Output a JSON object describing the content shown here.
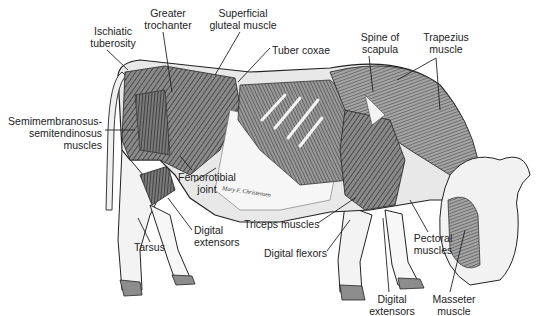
{
  "figure": {
    "signature": "Mary F. Christensen",
    "colors": {
      "ink": "#1e1e1e",
      "muscle_dark": "#3a3a3a",
      "muscle_mid": "#7a7a7a",
      "muscle_light": "#b8b8b8",
      "hoof": "#8c8c8c",
      "background": "#ffffff"
    }
  },
  "labels": [
    {
      "id": "ischiatic-tuberosity",
      "text": "Ischiatic\ntuberosity",
      "x": 82,
      "y": 25,
      "align": "c",
      "w": 62
    },
    {
      "id": "greater-trochanter",
      "text": "Greater\ntrochanter",
      "x": 136,
      "y": 7,
      "align": "c",
      "w": 64
    },
    {
      "id": "superficial-gluteal-muscle",
      "text": "Superficial\ngluteal muscle",
      "x": 202,
      "y": 7,
      "align": "c",
      "w": 82
    },
    {
      "id": "tuber-coxae",
      "text": "Tuber coxae",
      "x": 272,
      "y": 44,
      "align": "l",
      "w": 70
    },
    {
      "id": "spine-of-scapula",
      "text": "Spine of\nscapula",
      "x": 355,
      "y": 31,
      "align": "c",
      "w": 50
    },
    {
      "id": "trapezius-muscle",
      "text": "Trapezius\nmuscle",
      "x": 416,
      "y": 31,
      "align": "c",
      "w": 60
    },
    {
      "id": "semimembranosus-semitendinosus-muscles",
      "text": "Semimembranosus-\nsemitendinosus\nmuscles",
      "x": 2,
      "y": 115,
      "align": "r",
      "w": 100
    },
    {
      "id": "femorotibial-joint",
      "text": "Femorotibial\njoint",
      "x": 174,
      "y": 171,
      "align": "c",
      "w": 66
    },
    {
      "id": "digital-extensors-hind",
      "text": "Digital\nextensors",
      "x": 194,
      "y": 224,
      "align": "l",
      "w": 56
    },
    {
      "id": "tarsus",
      "text": "Tarsus",
      "x": 134,
      "y": 241,
      "align": "l",
      "w": 40
    },
    {
      "id": "triceps-muscles",
      "text": "Triceps muscles",
      "x": 244,
      "y": 218,
      "align": "l",
      "w": 90
    },
    {
      "id": "digital-flexors",
      "text": "Digital flexors",
      "x": 264,
      "y": 247,
      "align": "l",
      "w": 80
    },
    {
      "id": "pectoral-muscles",
      "text": "Pectoral\nmuscles",
      "x": 408,
      "y": 232,
      "align": "c",
      "w": 50
    },
    {
      "id": "digital-extensors-fore",
      "text": "Digital\nextensors",
      "x": 364,
      "y": 293,
      "align": "c",
      "w": 56
    },
    {
      "id": "masseter-muscle",
      "text": "Masseter\nmuscle",
      "x": 426,
      "y": 293,
      "align": "c",
      "w": 56
    }
  ],
  "leaders": [
    {
      "for": "ischiatic-tuberosity",
      "points": "107,50 128,70"
    },
    {
      "for": "greater-trochanter",
      "points": "163,32 172,92"
    },
    {
      "for": "superficial-gluteal-muscle",
      "points": "240,32 215,75"
    },
    {
      "for": "tuber-coxae",
      "points": "270,48 238,82"
    },
    {
      "for": "spine-of-scapula",
      "points": "369,56 373,92"
    },
    {
      "for": "trapezius-muscle",
      "points": "397,80 436,58 440,110"
    },
    {
      "for": "semimembranosus-semitendinosus-muscles",
      "points": "105,130 135,130"
    },
    {
      "for": "femorotibial-joint",
      "points": "192,170 180,156"
    },
    {
      "for": "femorotibial-joint-2",
      "points": "194,182 216,168"
    },
    {
      "for": "digital-extensors-hind",
      "points": "192,230 168,198"
    },
    {
      "for": "tarsus",
      "points": "150,242 138,218"
    },
    {
      "for": "triceps-muscles",
      "points": "318,223 355,198"
    },
    {
      "for": "digital-flexors",
      "points": "327,251 350,220"
    },
    {
      "for": "pectoral-muscles",
      "points": "428,232 410,200"
    },
    {
      "for": "digital-extensors-fore",
      "points": "389,292 383,218"
    },
    {
      "for": "masseter-muscle",
      "points": "450,292 465,230"
    }
  ]
}
